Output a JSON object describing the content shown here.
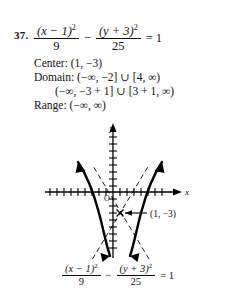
{
  "problem": {
    "number": "37."
  },
  "equation_top": {
    "numerator_left": "(x − 1)",
    "numerator_left_exp": "2",
    "denominator_left": "9",
    "operator": "−",
    "numerator_right": "(y + 3)",
    "numerator_right_exp": "2",
    "denominator_right": "25",
    "equals": "= 1"
  },
  "answers": {
    "center": "Center: (1, −3)",
    "domain_line1": "Domain: (−∞, −2] ∪ [4, ∞)",
    "domain_line2": "(−∞, −3 + 1] ∪ [3 + 1, ∞)",
    "range": "Range: (−∞, ∞)"
  },
  "graph": {
    "x_axis_label": "x",
    "y_axis_label": "y",
    "origin_label": "O",
    "center_point_label": "(1, −3)",
    "curve_color": "#000000",
    "asymptote_color": "#000000",
    "axis_color": "#000000",
    "curve_type": "hyperbola-horizontal-transverse",
    "center": [
      1,
      -3
    ],
    "a": 3,
    "b": 5,
    "vertices": [
      [
        -2,
        -3
      ],
      [
        4,
        -3
      ]
    ],
    "tick_count_x": 16,
    "tick_count_y": 18
  },
  "equation_bottom": {
    "numerator_left": "(x − 1)",
    "numerator_left_exp": "2",
    "denominator_left": "9",
    "operator": "−",
    "numerator_right": "(y + 3)",
    "numerator_right_exp": "2",
    "denominator_right": "25",
    "equals": "= 1"
  }
}
